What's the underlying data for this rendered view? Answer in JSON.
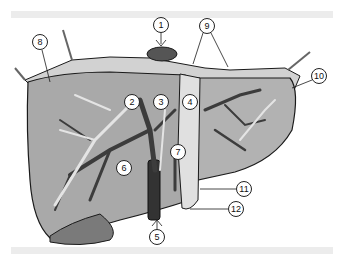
{
  "figure": {
    "callouts": [
      {
        "id": "c1",
        "label": "1",
        "x": 161,
        "y": 25
      },
      {
        "id": "c2",
        "label": "2",
        "x": 132,
        "y": 102
      },
      {
        "id": "c3",
        "label": "3",
        "x": 161,
        "y": 102
      },
      {
        "id": "c4",
        "label": "4",
        "x": 190,
        "y": 102
      },
      {
        "id": "c5",
        "label": "5",
        "x": 157,
        "y": 237
      },
      {
        "id": "c6",
        "label": "6",
        "x": 124,
        "y": 168
      },
      {
        "id": "c7",
        "label": "7",
        "x": 178,
        "y": 152
      },
      {
        "id": "c8",
        "label": "8",
        "x": 40,
        "y": 42
      },
      {
        "id": "c9",
        "label": "9",
        "x": 207,
        "y": 26
      },
      {
        "id": "c10",
        "label": "10",
        "x": 319,
        "y": 76
      },
      {
        "id": "c11",
        "label": "11",
        "x": 244,
        "y": 189
      },
      {
        "id": "c12",
        "label": "12",
        "x": 236,
        "y": 209
      }
    ],
    "colors": {
      "parenchyma": "#a9a9a9",
      "vein_dark": "#3c3c3c",
      "duct_light": "#e4e4e4",
      "capsule": "#d2d2d2",
      "outline": "#1a1a1a",
      "band": "#ececec"
    }
  }
}
